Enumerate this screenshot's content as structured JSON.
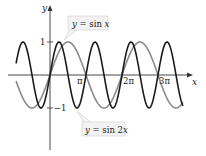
{
  "chart_data": {
    "type": "line",
    "title": "",
    "xlabel": "x",
    "ylabel": "y",
    "xlim": [
      -2.96,
      11.6
    ],
    "ylim": [
      -1,
      1
    ],
    "x_ticks": [
      {
        "value": 3.14159,
        "label": "π"
      },
      {
        "value": 6.28318,
        "label": "2π"
      },
      {
        "value": 9.42478,
        "label": "3π"
      }
    ],
    "y_ticks": [
      {
        "value": 1,
        "label": "1"
      },
      {
        "value": -1,
        "label": "−1"
      }
    ],
    "grid": false,
    "series": [
      {
        "name": "y = sin x",
        "function": "sin(x)",
        "color": "#8a8a8a",
        "period": "2π",
        "amplitude": 1
      },
      {
        "name": "y = sin 2x",
        "function": "sin(2x)",
        "color": "#1a1a1a",
        "period": "π",
        "amplitude": 1
      }
    ],
    "annotations": [
      {
        "text": "y = sin x",
        "points_to": "gray curve near x≈π/2"
      },
      {
        "text": "y = sin 2x",
        "points_to": "black curve near x≈3π/4"
      }
    ]
  },
  "labels": {
    "x_axis": "x",
    "y_axis": "y",
    "y_one": "1",
    "y_neg_one": "−1",
    "pi": "π",
    "two_pi": "2π",
    "three_pi": "3π",
    "callout_sinx_pre": "y",
    "callout_sinx_post": " = sin ",
    "callout_sinx_var": "x",
    "callout_sin2x_pre": "y",
    "callout_sin2x_post": " = sin 2",
    "callout_sin2x_var": "x"
  }
}
